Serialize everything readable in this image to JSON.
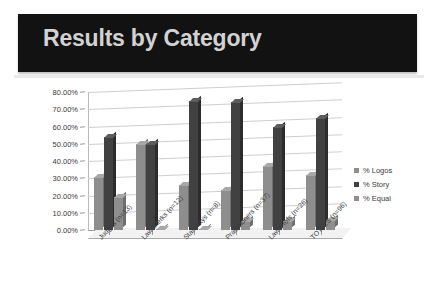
{
  "header": {
    "title": "Results by Category",
    "banner_color": "#121212",
    "title_color": "#d2d2d2"
  },
  "chart_data": {
    "type": "bar",
    "title": "Results by Category",
    "xlabel": "",
    "ylabel": "",
    "ylim": [
      0,
      80
    ],
    "grid": true,
    "legend_position": "right",
    "tick_labels": [
      "0.00%",
      "10.00%",
      "20.00%",
      "30.00%",
      "40.00%",
      "50.00%",
      "60.00%",
      "70.00%",
      "80.00%"
    ],
    "categories": [
      "Judges (n=13)",
      "Law Clerks (n=12)",
      "Staff Attys (n=8)",
      "Practitioners (n=37)",
      "Law Profs (n=26)",
      "TOTALS (n=96)"
    ],
    "series": [
      {
        "name": "% Logos",
        "color": "#8e8e8e",
        "values": [
          31,
          50,
          26,
          23,
          37,
          32
        ]
      },
      {
        "name": "% Story",
        "color": "#414141",
        "values": [
          54,
          50,
          75,
          74,
          60,
          65
        ]
      },
      {
        "name": "% Equal",
        "color": "#8e8e8e",
        "values": [
          19,
          0.5,
          0.5,
          5,
          5,
          6
        ]
      }
    ]
  }
}
